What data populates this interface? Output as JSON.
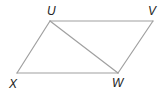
{
  "figure": {
    "type": "parallelogram-with-diagonal",
    "vertices": [
      {
        "id": "U",
        "label": "U",
        "x": 50,
        "y": 21,
        "label_x": 47,
        "label_y": 15
      },
      {
        "id": "V",
        "label": "V",
        "x": 153,
        "y": 21,
        "label_x": 148,
        "label_y": 15
      },
      {
        "id": "W",
        "label": "W",
        "x": 118,
        "y": 73,
        "label_x": 112,
        "label_y": 87
      },
      {
        "id": "X",
        "label": "X",
        "x": 17,
        "y": 73,
        "label_x": 9,
        "label_y": 88
      }
    ],
    "edges": [
      {
        "from": "U",
        "to": "V"
      },
      {
        "from": "V",
        "to": "W"
      },
      {
        "from": "W",
        "to": "X"
      },
      {
        "from": "X",
        "to": "U"
      },
      {
        "from": "U",
        "to": "W",
        "kind": "diagonal"
      }
    ],
    "line_color": "#a0a0a0",
    "label_color": "#222222"
  }
}
